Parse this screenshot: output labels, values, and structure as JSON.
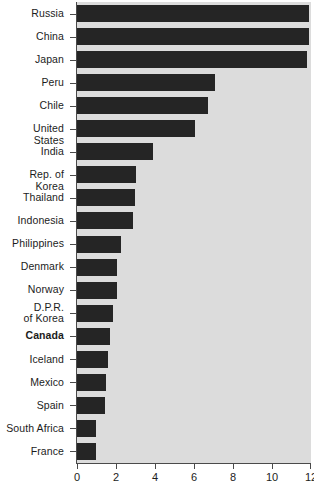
{
  "chart_data": {
    "type": "bar",
    "orientation": "horizontal",
    "title": "",
    "subtitle": "",
    "xlabel": "",
    "ylabel": "",
    "xlim": [
      0,
      12
    ],
    "ylim": null,
    "grid": false,
    "legend": null,
    "xticks": [
      0,
      2,
      4,
      6,
      8,
      10,
      12
    ],
    "xticklabels": [
      "0",
      "2",
      "4",
      "6",
      "8",
      "10",
      "12"
    ],
    "categories": [
      "Russia",
      "China",
      "Japan",
      "Peru",
      "Chile",
      "United States",
      "India",
      "Rep. of Korea",
      "Thailand",
      "Indonesia",
      "Philippines",
      "Denmark",
      "Norway",
      "D.P.R.\nof Korea",
      "Canada",
      "Iceland",
      "Mexico",
      "Spain",
      "South Africa",
      "France"
    ],
    "values": [
      11.9,
      11.9,
      11.8,
      7.1,
      6.7,
      6.05,
      3.9,
      3.0,
      2.95,
      2.85,
      2.25,
      2.05,
      2.05,
      1.85,
      1.7,
      1.6,
      1.5,
      1.45,
      0.95,
      0.95
    ],
    "highlighted_category": "Canada",
    "colors": {
      "bar": "#252525",
      "plot_background": "#dcdcdc",
      "figure_background": "#ffffff",
      "axis": "#4a4a4a",
      "text": "#1c1c1c"
    }
  }
}
